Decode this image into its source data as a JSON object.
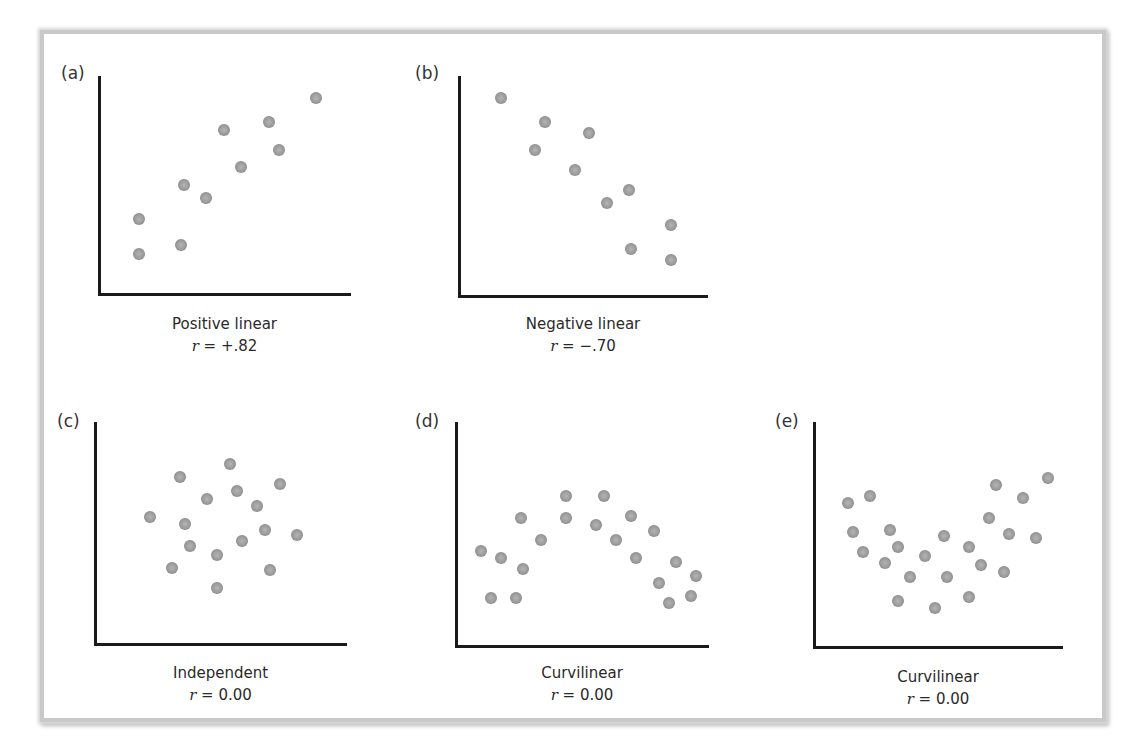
{
  "chart_data": [
    {
      "type": "scatter",
      "panel": "(a)",
      "title": "Positive linear",
      "annotation": "r = +.82",
      "r_value": "+.82",
      "xlabel": "",
      "ylabel": "",
      "xlim": [
        0,
        100
      ],
      "ylim": [
        0,
        100
      ],
      "grid": false,
      "x": [
        15,
        15,
        32,
        33,
        42,
        49,
        56,
        67,
        71,
        86
      ],
      "y": [
        18,
        34,
        22,
        50,
        44,
        75,
        58,
        79,
        66,
        90
      ]
    },
    {
      "type": "scatter",
      "panel": "(b)",
      "title": "Negative linear",
      "annotation": "r = −.70",
      "r_value": "−.70",
      "xlabel": "",
      "ylabel": "",
      "xlim": [
        0,
        100
      ],
      "ylim": [
        0,
        100
      ],
      "grid": false,
      "x": [
        16,
        34,
        30,
        52,
        46,
        68,
        59,
        85,
        69,
        85
      ],
      "y": [
        90,
        79,
        66,
        74,
        57,
        48,
        42,
        32,
        21,
        16
      ]
    },
    {
      "type": "scatter",
      "panel": "(c)",
      "title": "Independent",
      "annotation": "r = 0.00",
      "r_value": "0.00",
      "xlabel": "",
      "ylabel": "",
      "xlim": [
        0,
        100
      ],
      "ylim": [
        0,
        100
      ],
      "grid": false,
      "x": [
        53,
        33,
        73,
        56,
        44,
        64,
        21,
        35,
        67,
        80,
        37,
        58,
        48,
        30,
        69,
        48
      ],
      "y": [
        81,
        75,
        72,
        69,
        65,
        62,
        57,
        54,
        51,
        49,
        44,
        46,
        40,
        34,
        33,
        25
      ]
    },
    {
      "type": "scatter",
      "panel": "(d)",
      "title": "Curvilinear",
      "annotation": "r = 0.00",
      "r_value": "0.00",
      "xlabel": "",
      "ylabel": "",
      "xlim": [
        0,
        100
      ],
      "ylim": [
        0,
        100
      ],
      "grid": false,
      "x": [
        43,
        58,
        25,
        43,
        69,
        55,
        78,
        33,
        63,
        9,
        17,
        26,
        71,
        87,
        95,
        80,
        13,
        23,
        93,
        84
      ],
      "y": [
        67,
        67,
        57,
        57,
        58,
        54,
        51,
        47,
        47,
        42,
        39,
        34,
        39,
        37,
        31,
        28,
        21,
        21,
        22,
        19
      ]
    },
    {
      "type": "scatter",
      "panel": "(e)",
      "title": "Curvilinear",
      "annotation": "r = 0.00",
      "r_value": "0.00",
      "xlabel": "",
      "ylabel": "",
      "xlim": [
        0,
        100
      ],
      "ylim": [
        0,
        100
      ],
      "grid": false,
      "x": [
        13,
        22,
        73,
        94,
        84,
        15,
        30,
        70,
        52,
        78,
        89,
        33,
        62,
        19,
        44,
        28,
        67,
        76,
        38,
        53,
        33,
        48,
        62
      ],
      "y": [
        64,
        67,
        72,
        75,
        66,
        51,
        52,
        57,
        49,
        50,
        48,
        44,
        44,
        42,
        40,
        37,
        36,
        33,
        31,
        31,
        20,
        17,
        22
      ]
    }
  ],
  "panels": [
    {
      "letter": "(a)",
      "title": "Positive linear",
      "r_prefix": "r",
      "r_rest": " = +.82"
    },
    {
      "letter": "(b)",
      "title": "Negative linear",
      "r_prefix": "r",
      "r_rest": " = −.70"
    },
    {
      "letter": "(c)",
      "title": "Independent",
      "r_prefix": "r",
      "r_rest": " = 0.00"
    },
    {
      "letter": "(d)",
      "title": "Curvilinear",
      "r_prefix": "r",
      "r_rest": " = 0.00"
    },
    {
      "letter": "(e)",
      "title": "Curvilinear",
      "r_prefix": "r",
      "r_rest": " = 0.00"
    }
  ],
  "style": {
    "dot_color": "#9a9a9a",
    "axis_color": "#1a1a1a",
    "frame_border_color": "#c9c9c9"
  }
}
